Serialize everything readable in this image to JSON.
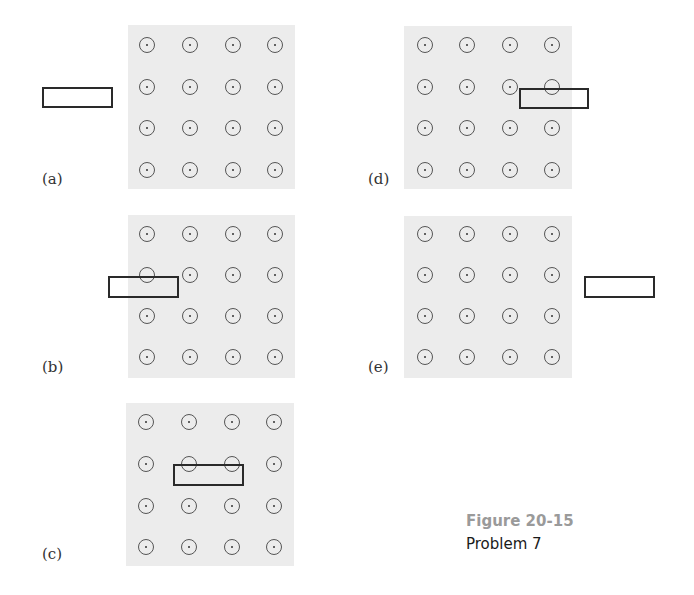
{
  "figure": {
    "title": "Figure 20-15",
    "subtitle": "Problem 7",
    "title_color": "#9a9a9a",
    "field_color": "#ececec",
    "field_symbol": "dot-in-circle (magnetic field out of page)",
    "grid": {
      "rows": 4,
      "cols": 4
    }
  },
  "panels": [
    {
      "id": "a",
      "label": "(a)",
      "field": {
        "x": 128,
        "y": 25,
        "w": 167,
        "h": 164
      },
      "cols_x": [
        147,
        190,
        233,
        275
      ],
      "rows_y": [
        45,
        87,
        128,
        170
      ],
      "loop": {
        "x": 42,
        "y": 87,
        "w": 71,
        "h": 21,
        "position": "left of field, outside"
      },
      "label_pos": {
        "x": 42,
        "y": 170
      }
    },
    {
      "id": "b",
      "label": "(b)",
      "field": {
        "x": 128,
        "y": 215,
        "w": 167,
        "h": 163
      },
      "cols_x": [
        147,
        190,
        233,
        275
      ],
      "rows_y": [
        234,
        275,
        316,
        357
      ],
      "loop": {
        "x": 108,
        "y": 276,
        "w": 71,
        "h": 22,
        "position": "entering field from left"
      },
      "label_pos": {
        "x": 42,
        "y": 358
      }
    },
    {
      "id": "c",
      "label": "(c)",
      "field": {
        "x": 126,
        "y": 403,
        "w": 168,
        "h": 163
      },
      "cols_x": [
        146,
        189,
        232,
        274
      ],
      "rows_y": [
        422,
        464,
        506,
        547
      ],
      "loop": {
        "x": 173,
        "y": 464,
        "w": 71,
        "h": 22,
        "position": "fully inside field"
      },
      "label_pos": {
        "x": 42,
        "y": 545
      }
    },
    {
      "id": "d",
      "label": "(d)",
      "field": {
        "x": 404,
        "y": 26,
        "w": 168,
        "h": 163
      },
      "cols_x": [
        425,
        467,
        510,
        552
      ],
      "rows_y": [
        45,
        87,
        128,
        170
      ],
      "loop": {
        "x": 519,
        "y": 88,
        "w": 70,
        "h": 21,
        "position": "leaving field to right"
      },
      "label_pos": {
        "x": 368,
        "y": 170
      }
    },
    {
      "id": "e",
      "label": "(e)",
      "field": {
        "x": 404,
        "y": 216,
        "w": 168,
        "h": 162
      },
      "cols_x": [
        425,
        467,
        510,
        552
      ],
      "rows_y": [
        234,
        275,
        316,
        357
      ],
      "loop": {
        "x": 584,
        "y": 276,
        "w": 71,
        "h": 22,
        "position": "right of field, outside"
      },
      "label_pos": {
        "x": 368,
        "y": 358
      }
    }
  ]
}
